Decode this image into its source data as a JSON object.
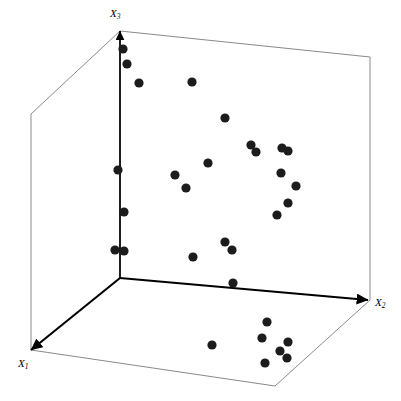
{
  "figure": {
    "width": 401,
    "height": 401,
    "background": "#ffffff",
    "point_color": "#1c1c1c",
    "axis_color": "#000000",
    "box_color": "#8a8a8a",
    "point_radius": 4.6
  },
  "labels": {
    "x1": "X",
    "x1_sub": "1",
    "x2": "X",
    "x2_sub": "2",
    "x3": "X",
    "x3_sub": "3"
  },
  "geometry": {
    "origin": [
      120,
      278
    ],
    "x1_end": [
      31,
      350
    ],
    "x2_end": [
      368,
      300
    ],
    "x3_end": [
      120,
      31
    ],
    "floor": [
      [
        31,
        350
      ],
      [
        275,
        386
      ],
      [
        370,
        300
      ],
      [
        120,
        278
      ]
    ],
    "back_top": [
      [
        31,
        114
      ],
      [
        120,
        31
      ],
      [
        370,
        57
      ],
      [
        370,
        300
      ]
    ],
    "left_vertical": [
      [
        31,
        114
      ],
      [
        31,
        350
      ]
    ],
    "right_vertical": [
      [
        370,
        57
      ],
      [
        370,
        300
      ]
    ],
    "top_back_left": [
      [
        31,
        114
      ],
      [
        120,
        31
      ]
    ],
    "top_back_right": [
      [
        120,
        31
      ],
      [
        370,
        57
      ]
    ]
  },
  "chart_data": {
    "type": "scatter",
    "title": "",
    "xlabel": "X2",
    "ylabel": "X1",
    "zlabel": "X3",
    "grid": false,
    "legend": null,
    "axes": [
      "X1",
      "X2",
      "X3"
    ],
    "n_points": 30,
    "projection": "3d-isometric-box",
    "points_px": [
      [
        123,
        49
      ],
      [
        127,
        64
      ],
      [
        139,
        83
      ],
      [
        192,
        82
      ],
      [
        225,
        118
      ],
      [
        251,
        145
      ],
      [
        256,
        152
      ],
      [
        282,
        148
      ],
      [
        288,
        151
      ],
      [
        208,
        163
      ],
      [
        118,
        170
      ],
      [
        175,
        175
      ],
      [
        281,
        173
      ],
      [
        186,
        188
      ],
      [
        296,
        186
      ],
      [
        124,
        212
      ],
      [
        288,
        203
      ],
      [
        277,
        215
      ],
      [
        225,
        242
      ],
      [
        232,
        250
      ],
      [
        115,
        250
      ],
      [
        124,
        251
      ],
      [
        193,
        257
      ],
      [
        233,
        283
      ],
      [
        267,
        322
      ],
      [
        262,
        338
      ],
      [
        288,
        342
      ],
      [
        212,
        345
      ],
      [
        280,
        351
      ],
      [
        287,
        358
      ],
      [
        265,
        363
      ]
    ]
  }
}
